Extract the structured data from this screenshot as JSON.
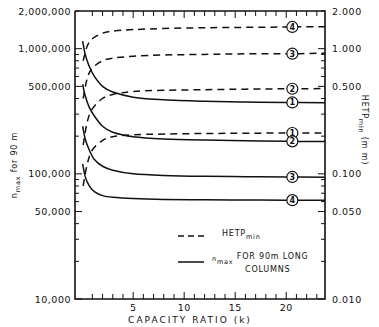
{
  "chart_data": {
    "type": "line",
    "title": "",
    "xlabel": "CAPACITY RATIO (k)",
    "ylabel_left": "n max for 90 m",
    "ylabel_right": "HETP min (mm)",
    "xlim": [
      -0.7,
      23.8
    ],
    "ylim_left": [
      10000,
      2000000
    ],
    "ylim_right": [
      0.01,
      2.0
    ],
    "yscale": "log",
    "x_ticks": [
      5,
      10,
      15,
      20
    ],
    "x_tick_labels": [
      "5",
      "10",
      "15",
      "20"
    ],
    "y_left_tick_labels": [
      "2,000,000",
      "1,000,000",
      "500,000",
      "100,000",
      "50,000",
      "10,000"
    ],
    "y_left_tick_values": [
      2000000,
      1000000,
      500000,
      100000,
      50000,
      10000
    ],
    "y_right_tick_labels": [
      "2.000",
      "1.000",
      "0.500",
      "0.100",
      "0.050",
      "0.010"
    ],
    "y_right_tick_values": [
      2.0,
      1.0,
      0.5,
      0.1,
      0.05,
      0.01
    ],
    "legend": [
      {
        "style": "dashed",
        "label": "HETP",
        "sub": "min"
      },
      {
        "style": "solid",
        "label_pre": "n",
        "sub": "max",
        "label": "FOR 90m LONG",
        "label2": "COLUMNS"
      }
    ],
    "legend_position": "lower-right-inside",
    "grid": false,
    "series": [
      {
        "name": "HETP min (1)",
        "style": "dashed",
        "curve_id": "1",
        "x": [
          0.1,
          0.5,
          1,
          2,
          3,
          5,
          8,
          12,
          16,
          20,
          23.8
        ],
        "values_right_axis": [
          0.08,
          0.12,
          0.155,
          0.185,
          0.198,
          0.205,
          0.208,
          0.21,
          0.211,
          0.212,
          0.212
        ]
      },
      {
        "name": "HETP min (2)",
        "style": "dashed",
        "curve_id": "2",
        "x": [
          0.1,
          0.5,
          1,
          2,
          3,
          5,
          8,
          12,
          16,
          20,
          23.8
        ],
        "values_right_axis": [
          0.17,
          0.26,
          0.33,
          0.4,
          0.43,
          0.455,
          0.465,
          0.47,
          0.475,
          0.478,
          0.48
        ]
      },
      {
        "name": "HETP min (3)",
        "style": "dashed",
        "curve_id": "3",
        "x": [
          0.1,
          0.5,
          1,
          2,
          3,
          5,
          8,
          12,
          16,
          20,
          23.8
        ],
        "values_right_axis": [
          0.4,
          0.58,
          0.7,
          0.8,
          0.84,
          0.87,
          0.89,
          0.9,
          0.91,
          0.91,
          0.92
        ]
      },
      {
        "name": "HETP min (4)",
        "style": "dashed",
        "curve_id": "4",
        "x": [
          0.1,
          0.5,
          1,
          2,
          3,
          5,
          8,
          12,
          16,
          20,
          23.8
        ],
        "values_right_axis": [
          0.8,
          1.05,
          1.2,
          1.33,
          1.38,
          1.42,
          1.45,
          1.47,
          1.48,
          1.49,
          1.5
        ]
      },
      {
        "name": "n max (1)",
        "style": "solid",
        "curve_id": "1",
        "x": [
          0.05,
          0.3,
          0.7,
          1.2,
          2,
          3,
          5,
          8,
          12,
          16,
          20,
          23.8
        ],
        "values": [
          1150000,
          900000,
          720000,
          600000,
          500000,
          450000,
          410000,
          390000,
          380000,
          375000,
          372000,
          370000
        ]
      },
      {
        "name": "n max (2)",
        "style": "solid",
        "curve_id": "2",
        "x": [
          0.05,
          0.3,
          0.7,
          1.2,
          2,
          3,
          5,
          8,
          12,
          16,
          20,
          23.8
        ],
        "values": [
          520000,
          420000,
          340000,
          290000,
          240000,
          215000,
          198000,
          190000,
          186000,
          184000,
          182000,
          181000
        ]
      },
      {
        "name": "n max (3)",
        "style": "solid",
        "curve_id": "3",
        "x": [
          0.05,
          0.3,
          0.7,
          1.2,
          2,
          3,
          5,
          8,
          12,
          16,
          20,
          23.8
        ],
        "values": [
          240000,
          190000,
          155000,
          130000,
          115000,
          107000,
          100000,
          97000,
          95500,
          95000,
          94500,
          94000
        ]
      },
      {
        "name": "n max (4)",
        "style": "solid",
        "curve_id": "4",
        "x": [
          0.05,
          0.3,
          0.7,
          1.2,
          2,
          3,
          5,
          8,
          12,
          16,
          20,
          23.8
        ],
        "values": [
          120000,
          95000,
          80000,
          72000,
          67000,
          65000,
          63500,
          62500,
          62000,
          61800,
          61600,
          61500
        ]
      }
    ]
  }
}
